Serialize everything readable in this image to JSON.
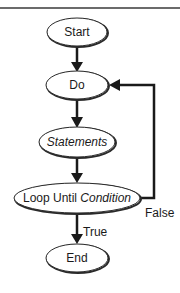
{
  "diagram": {
    "type": "flowchart",
    "colors": {
      "stroke": "#2a2a2a",
      "fill": "#ffffff",
      "text": "#1a1a1a",
      "top_rule": "#6b6b6b"
    },
    "nodes": [
      {
        "id": "start",
        "shape": "ellipse",
        "label": "Start"
      },
      {
        "id": "do",
        "shape": "ellipse",
        "label": "Do"
      },
      {
        "id": "statements",
        "shape": "ellipse",
        "label": "Statements",
        "italic": true
      },
      {
        "id": "loop",
        "shape": "ellipse",
        "label_plain": "Loop Until ",
        "label_italic": "Condition"
      },
      {
        "id": "end",
        "shape": "ellipse",
        "label": "End"
      }
    ],
    "edges": [
      {
        "from": "start",
        "to": "do",
        "label": ""
      },
      {
        "from": "do",
        "to": "statements",
        "label": ""
      },
      {
        "from": "statements",
        "to": "loop",
        "label": ""
      },
      {
        "from": "loop",
        "to": "end",
        "label": "True"
      },
      {
        "from": "loop",
        "to": "do",
        "label": "False"
      }
    ]
  }
}
